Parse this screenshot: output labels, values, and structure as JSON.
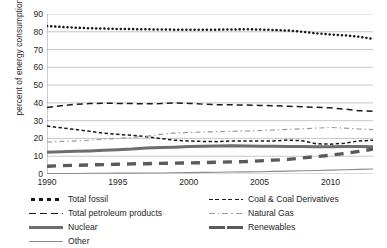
{
  "chart_data": {
    "type": "line",
    "title": "",
    "xlabel": "",
    "ylabel": "percent of energy consumption",
    "xlim": [
      1990,
      2013
    ],
    "ylim": [
      0,
      90
    ],
    "ytick_step": 10,
    "yticks": [
      0,
      10,
      20,
      30,
      40,
      50,
      60,
      70,
      80,
      90
    ],
    "xticks": [
      1990,
      1995,
      2000,
      2005,
      2010
    ],
    "grid": "horizontal",
    "legend_position": "below-plot-two-columns",
    "x": [
      1990,
      1991,
      1992,
      1993,
      1994,
      1995,
      1996,
      1997,
      1998,
      1999,
      2000,
      2001,
      2002,
      2003,
      2004,
      2005,
      2006,
      2007,
      2008,
      2009,
      2010,
      2011,
      2012,
      2013
    ],
    "series": [
      {
        "name": "Total fossil",
        "style": "dotted",
        "color": "#1a1a1a",
        "values": [
          83.2,
          82.7,
          82.3,
          82.0,
          81.8,
          81.6,
          81.5,
          81.4,
          81.3,
          81.2,
          81.2,
          81.1,
          81.2,
          81.3,
          81.4,
          81.3,
          81.0,
          80.7,
          80.0,
          79.1,
          78.5,
          78.0,
          77.2,
          76.0
        ]
      },
      {
        "name": "Total petroleum products",
        "style": "dashed",
        "color": "#1a1a1a",
        "values": [
          37.4,
          38.4,
          39.2,
          39.6,
          39.8,
          39.7,
          39.6,
          39.5,
          39.6,
          40.0,
          39.7,
          39.3,
          39.0,
          38.9,
          38.8,
          38.6,
          38.4,
          38.1,
          37.8,
          37.5,
          37.2,
          36.5,
          35.6,
          35.3
        ]
      },
      {
        "name": "Coal & Coal Derivatives",
        "style": "fine-dashed",
        "color": "#1a1a1a",
        "values": [
          27.0,
          26.0,
          25.0,
          24.0,
          23.0,
          22.3,
          21.7,
          21.0,
          20.0,
          19.0,
          18.6,
          18.3,
          18.2,
          18.6,
          18.6,
          18.5,
          18.6,
          19.1,
          18.7,
          17.0,
          16.8,
          17.3,
          18.6,
          19.0
        ]
      },
      {
        "name": "Natural Gas",
        "style": "dash-dot",
        "color": "#9a9a9a",
        "values": [
          18.0,
          18.3,
          18.6,
          19.0,
          19.6,
          20.0,
          20.6,
          21.2,
          22.3,
          23.0,
          23.4,
          23.6,
          23.8,
          24.0,
          24.2,
          24.4,
          24.7,
          25.1,
          25.4,
          25.8,
          26.2,
          25.8,
          25.3,
          25.0
        ]
      },
      {
        "name": "Nuclear",
        "style": "thick-solid",
        "color": "#6e6e6e",
        "values": [
          12.2,
          12.5,
          12.8,
          13.0,
          13.3,
          13.6,
          14.0,
          14.6,
          14.9,
          15.1,
          15.4,
          15.6,
          15.8,
          15.9,
          15.8,
          15.6,
          15.6,
          15.5,
          15.4,
          15.3,
          15.3,
          15.4,
          15.4,
          15.3
        ]
      },
      {
        "name": "Renewables",
        "style": "thick-dashed",
        "color": "#5a5a5a",
        "values": [
          4.4,
          4.7,
          4.9,
          5.1,
          5.3,
          5.5,
          5.7,
          5.8,
          6.0,
          6.1,
          6.2,
          6.4,
          6.6,
          6.8,
          7.0,
          7.4,
          7.8,
          8.2,
          9.0,
          9.8,
          10.6,
          11.5,
          12.7,
          14.0
        ]
      },
      {
        "name": "Other",
        "style": "thin-solid",
        "color": "#8a8a8a",
        "values": [
          0.2,
          0.3,
          0.3,
          0.4,
          0.4,
          0.5,
          0.5,
          0.6,
          0.6,
          0.7,
          0.8,
          0.9,
          1.0,
          1.1,
          1.2,
          1.3,
          1.5,
          1.6,
          1.8,
          2.0,
          2.2,
          2.4,
          2.6,
          2.8
        ]
      }
    ]
  },
  "legend": {
    "left_column": [
      {
        "label": "Total fossil",
        "key": "dotted"
      },
      {
        "label": "Total petroleum products",
        "key": "dashed"
      },
      {
        "label": "Nuclear",
        "key": "thick-solid"
      },
      {
        "label": "Other",
        "key": "thin-solid"
      }
    ],
    "right_column": [
      {
        "label": "Coal & Coal Derivatives",
        "key": "fine-dashed"
      },
      {
        "label": "Natural Gas",
        "key": "dash-dot"
      },
      {
        "label": "Renewables",
        "key": "thick-dashed"
      }
    ]
  }
}
